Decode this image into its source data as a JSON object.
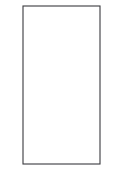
{
  "figure": {
    "type": "line-drawing",
    "background_color": "#ffffff",
    "stroke_color": "#3a3a3e",
    "circle_stroke_color": "#4a4a50",
    "fill_color": "#ffffff",
    "stroke_width": 1.1,
    "canvas": {
      "width": 125,
      "height": 196
    }
  },
  "tower": {
    "label": "tower-body",
    "x": 23,
    "y": 6,
    "width": 77,
    "height": 158
  },
  "base": {
    "label": "base-block",
    "x": 9,
    "y": 163,
    "width": 107,
    "height": 28,
    "wave": {
      "label": "wavy-bottom-edge",
      "humps": 4,
      "amplitude": 7,
      "baseline_y": 187
    }
  },
  "port_grid": {
    "label": "circle-grid",
    "columns": 3,
    "rows": 6,
    "count": 18,
    "radius": 6,
    "column_centers_x": [
      37,
      61,
      85
    ],
    "row_centers_y": [
      22,
      46,
      70,
      94,
      118,
      145
    ]
  }
}
